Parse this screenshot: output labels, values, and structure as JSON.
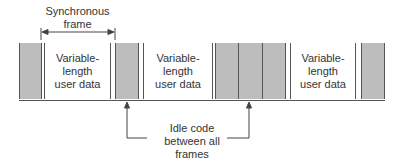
{
  "diagram": {
    "frame_label_line1": "Synchronous",
    "frame_label_line2": "frame",
    "data_blocks": [
      {
        "line1": "Variable-",
        "line2": "length",
        "line3": "user data"
      },
      {
        "line1": "Variable-",
        "line2": "length",
        "line3": "user data"
      },
      {
        "line1": "Variable-",
        "line2": "length",
        "line3": "user data"
      }
    ],
    "idle_label_line1": "Idle code",
    "idle_label_line2": "between all",
    "idle_label_line3": "frames",
    "colors": {
      "idle_fill": "#bdbdbd",
      "data_fill": "#ffffff",
      "line": "#555555"
    }
  }
}
